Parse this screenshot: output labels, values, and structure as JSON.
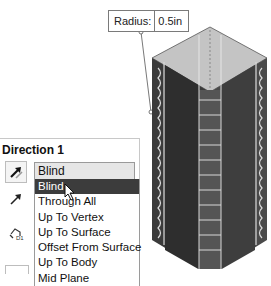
{
  "viewport": {
    "dimension_label": "Radius:",
    "dimension_value": "0.5in",
    "colors": {
      "top_face": "#c4c4c4",
      "left_face": "#3a3a3a",
      "right_face": "#4a4a4a",
      "edge_pattern": "#d8d8d8"
    }
  },
  "panel": {
    "title": "Direction 1",
    "end_condition": {
      "selected": "Blind",
      "options": [
        "Blind",
        "Through All",
        "Up To Vertex",
        "Up To Surface",
        "Offset From Surface",
        "Up To Body",
        "Mid Plane"
      ],
      "highlighted_index": 0
    },
    "icons": [
      "reverse-direction-icon",
      "direction-arrow-icon",
      "offset-distance-icon"
    ]
  }
}
